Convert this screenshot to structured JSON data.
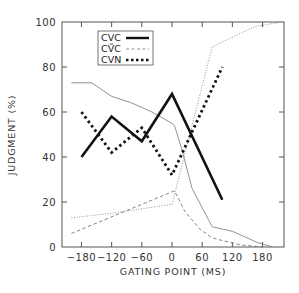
{
  "chart_data": {
    "type": "line",
    "title": "",
    "xlabel": "GATING POINT (MS)",
    "ylabel": "JUDGMENT (%)",
    "xlim": [
      -220,
      222
    ],
    "ylim": [
      0,
      100
    ],
    "xticks": [
      -180,
      -120,
      -60,
      0,
      60,
      120,
      180
    ],
    "xtick_labels": [
      "−180",
      "−120",
      "−60",
      "0",
      "60",
      "120",
      "180"
    ],
    "yticks": [
      0,
      20,
      40,
      60,
      80,
      100
    ],
    "ytick_labels": [
      "0",
      "20",
      "40",
      "60",
      "80",
      "100"
    ],
    "grid": false,
    "legend_position": "upper-center-left",
    "series": [
      {
        "name": "CVC",
        "style": "thick-solid",
        "in_legend": true,
        "x": [
          -180,
          -120,
          -60,
          0,
          100
        ],
        "y": [
          40,
          58,
          47,
          68,
          21
        ]
      },
      {
        "name": "CṼC",
        "style": "thin-dashed",
        "in_legend": true,
        "x": [
          -200,
          5,
          25,
          55,
          80,
          135,
          180
        ],
        "y": [
          6,
          25,
          16,
          8,
          4,
          1,
          0
        ]
      },
      {
        "name": "CVN",
        "style": "thick-dotted",
        "in_legend": true,
        "x": [
          -180,
          -120,
          -60,
          0,
          100
        ],
        "y": [
          60,
          42,
          53,
          32,
          80
        ]
      },
      {
        "name": "unlabeled-thin-solid",
        "style": "thin-solid",
        "in_legend": false,
        "x": [
          -200,
          -160,
          -120,
          -80,
          -40,
          0,
          5,
          20,
          40,
          80,
          120,
          170,
          200
        ],
        "y": [
          73,
          73,
          67,
          64,
          60,
          55,
          54,
          43,
          26,
          9,
          7,
          2,
          0
        ]
      },
      {
        "name": "unlabeled-thin-dotted",
        "style": "thin-dotted",
        "in_legend": false,
        "x": [
          -200,
          -120,
          0,
          80,
          165,
          220
        ],
        "y": [
          13,
          15,
          19,
          89,
          98,
          100
        ]
      }
    ]
  },
  "legend": {
    "items": [
      {
        "label": "CVC",
        "style": "thick-solid"
      },
      {
        "label": "CṼC",
        "style": "thin-dashed"
      },
      {
        "label": "CVN",
        "style": "thick-dotted"
      }
    ]
  },
  "axes": {
    "xlabel": "GATING POINT (MS)",
    "ylabel": "JUDGMENT (%)"
  },
  "colors": {
    "axis": "#555555",
    "series": "#111111",
    "thin": "#666666"
  }
}
